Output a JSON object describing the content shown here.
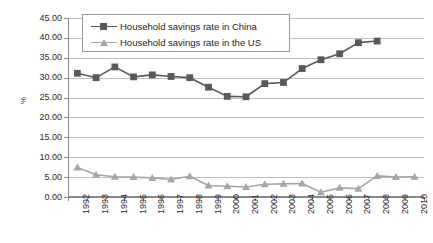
{
  "chart_data": {
    "type": "line",
    "title": "",
    "xlabel": "",
    "ylabel": "%",
    "ylim": [
      0,
      45
    ],
    "ytick_step": 5,
    "ytick_labels": [
      "0.00",
      "5.00",
      "10.00",
      "15.00",
      "20.00",
      "25.00",
      "30.00",
      "35.00",
      "40.00",
      "45.00"
    ],
    "ytick_values": [
      0,
      5,
      10,
      15,
      20,
      25,
      30,
      35,
      40,
      45
    ],
    "grid": true,
    "legend_position": "top-left",
    "categories": [
      "1992",
      "1993",
      "1994",
      "1995",
      "1996",
      "1997",
      "1998",
      "1999",
      "2000",
      "2001",
      "2002",
      "2003",
      "2004",
      "2005",
      "2006",
      "2007",
      "2008",
      "2009",
      "2010"
    ],
    "series": [
      {
        "name": "Household savings rate in China",
        "marker": "square",
        "color": "#595959",
        "values": [
          31.1,
          30.0,
          32.7,
          30.2,
          30.7,
          30.3,
          30.0,
          27.6,
          25.3,
          25.2,
          28.5,
          28.8,
          32.3,
          34.5,
          36.0,
          38.8,
          39.2,
          null,
          null
        ]
      },
      {
        "name": "Household savings rate in the US",
        "marker": "triangle",
        "color": "#a6a6a6",
        "values": [
          7.4,
          5.6,
          5.1,
          5.0,
          4.8,
          4.4,
          5.2,
          2.9,
          2.7,
          2.5,
          3.2,
          3.3,
          3.4,
          1.2,
          2.3,
          2.1,
          5.3,
          5.0,
          5.1
        ]
      }
    ]
  },
  "legend": {
    "entries": [
      {
        "label": "Household savings rate in China"
      },
      {
        "label": "Household savings rate in the US"
      }
    ]
  },
  "colors": {
    "china": "#595959",
    "us": "#a6a6a6",
    "gridline": "#bfbfbf",
    "axis": "#8a8a8a",
    "text": "#2b2b2b"
  }
}
